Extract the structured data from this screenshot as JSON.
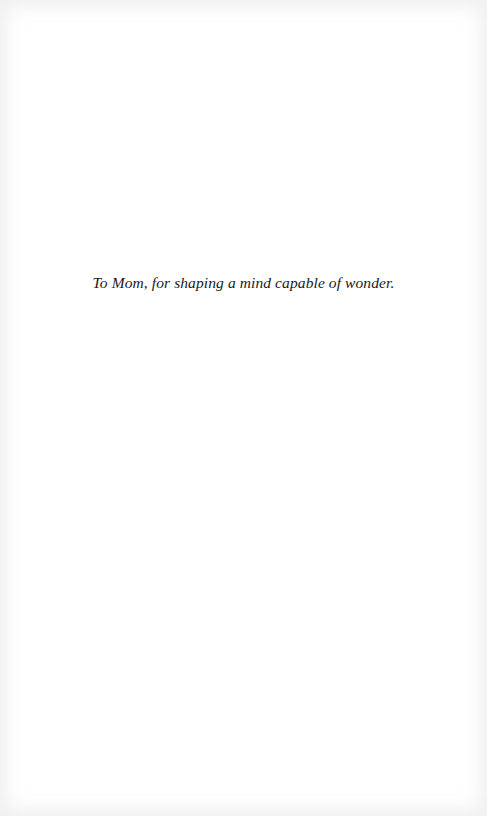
{
  "page": {
    "type": "dedication",
    "dedication_text": "To Mom, for shaping a mind capable of wonder."
  }
}
